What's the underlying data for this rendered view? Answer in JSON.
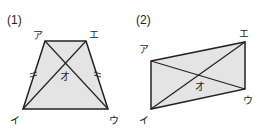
{
  "figures": [
    {
      "number_label": "(1)",
      "shape": "trapezoid",
      "vertices": {
        "a": "ア",
        "e": "エ",
        "u": "ウ",
        "i": "イ"
      },
      "intersection": "オ",
      "tick_marks": "=",
      "fill_color": "#e4e4e4",
      "stroke_color": "#222222"
    },
    {
      "number_label": "(2)",
      "shape": "parallelogram",
      "vertices": {
        "a": "ア",
        "e": "エ",
        "u": "ウ",
        "i": "イ"
      },
      "intersection": "オ",
      "fill_color": "#e4e4e4",
      "stroke_color": "#222222"
    }
  ]
}
